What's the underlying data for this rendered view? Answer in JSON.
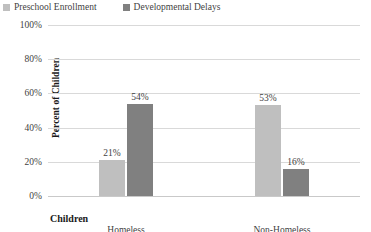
{
  "chart_data": {
    "type": "bar",
    "title": "",
    "xlabel": "Children",
    "ylabel": "Percent of Children",
    "categories": [
      "Homeless",
      "Non-Homeless"
    ],
    "series": [
      {
        "name": "Preschool Enrollment",
        "color": "#bfbfbf",
        "values": [
          21,
          53
        ],
        "labels": [
          "21%",
          "53%"
        ]
      },
      {
        "name": "Developmental Delays",
        "color": "#808080",
        "values": [
          54,
          16
        ],
        "labels": [
          "54%",
          "16%"
        ]
      }
    ],
    "ylim": [
      0,
      100
    ],
    "yticks": [
      100,
      80,
      60,
      40,
      20,
      0
    ],
    "ytick_labels": [
      "100%",
      "80%",
      "60%",
      "40%",
      "20%",
      "0%"
    ],
    "grid": "horizontal",
    "legend_position": "top-left",
    "gridline_color": "#d9d9d9",
    "text_color": "#3f3f3f"
  }
}
